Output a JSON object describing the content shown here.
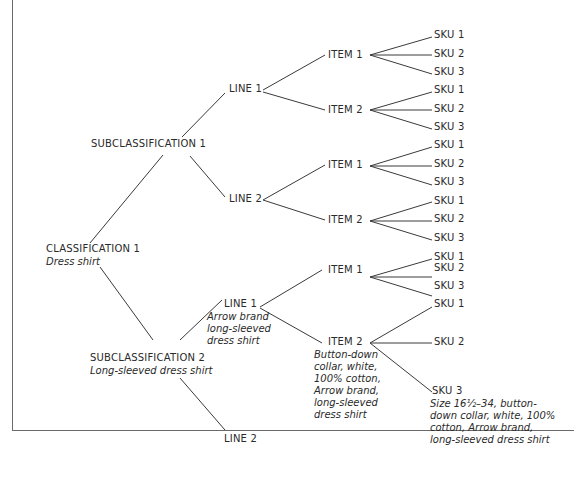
{
  "diagram": {
    "classification": {
      "label": "CLASSIFICATION 1",
      "desc": "Dress shirt"
    },
    "subclass1": {
      "label": "SUBCLASSIFICATION 1"
    },
    "subclass2": {
      "label": "SUBCLASSIFICATION 2",
      "desc": "Long-sleeved dress shirt"
    },
    "s1_line1": {
      "label": "LINE 1"
    },
    "s1_line2": {
      "label": "LINE 2"
    },
    "s2_line1": {
      "label": "LINE 1",
      "desc": "Arrow brand\nlong-sleeved\ndress shirt"
    },
    "s2_line2": {
      "label": "LINE 2"
    },
    "items": {
      "a1": "ITEM 1",
      "a2": "ITEM 2",
      "b1": "ITEM 1",
      "b2": "ITEM 2",
      "c1": "ITEM 1",
      "c2": "ITEM 2",
      "c2_desc": "Button-down\ncollar, white,\n100% cotton,\nArrow brand,\nlong-sleeved\ndress shirt"
    },
    "skus": {
      "sku1": "SKU 1",
      "sku2": "SKU 2",
      "sku3": "SKU 3",
      "c2_sku3_desc": "Size 16½–34, button-\ndown collar, white, 100%\ncotton, Arrow brand,\nlong-sleeved dress shirt"
    }
  }
}
